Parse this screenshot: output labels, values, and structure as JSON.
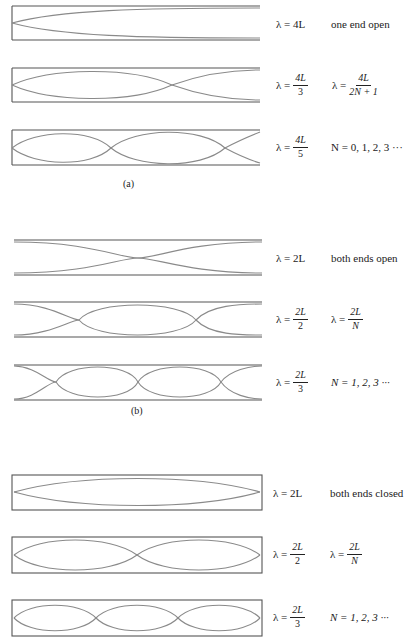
{
  "figure": {
    "stroke_color": "#555555",
    "wave_color": "#8a8a8a",
    "panels": [
      {
        "id": "a",
        "caption": "(a)",
        "boundary": "one end open",
        "rows": [
          {
            "harmonic": 1,
            "lambda_text": "λ = 4L",
            "lambda_num": "4L",
            "lambda_den": "",
            "note": "one end open"
          },
          {
            "harmonic": 3,
            "lambda_text": "λ = 4L/3",
            "lambda_num": "4L",
            "lambda_den": "3",
            "note_prefix": "λ =",
            "note_num": "4L",
            "note_den": "2N + 1"
          },
          {
            "harmonic": 5,
            "lambda_text": "λ = 4L/5",
            "lambda_num": "4L",
            "lambda_den": "5",
            "note": "N = 0, 1, 2, 3  ···"
          }
        ]
      },
      {
        "id": "b",
        "caption": "(b)",
        "boundary": "both ends open",
        "rows": [
          {
            "harmonic": 1,
            "lambda_text": "λ = 2L",
            "lambda_num": "2L",
            "lambda_den": "",
            "note": "both ends open"
          },
          {
            "harmonic": 2,
            "lambda_text": "λ = 2L/2",
            "lambda_num": "2L",
            "lambda_den": "2",
            "note_prefix": "λ =",
            "note_num": "2L",
            "note_den": "N"
          },
          {
            "harmonic": 3,
            "lambda_text": "λ = 2L/3",
            "lambda_num": "2L",
            "lambda_den": "3",
            "note": "N = 1, 2, 3  ···"
          }
        ]
      },
      {
        "id": "c",
        "caption": "",
        "boundary": "both ends closed",
        "rows": [
          {
            "harmonic": 1,
            "lambda_text": "λ = 2L",
            "lambda_num": "2L",
            "lambda_den": "",
            "note": "both ends closed"
          },
          {
            "harmonic": 2,
            "lambda_text": "λ = 2L/2",
            "lambda_num": "2L",
            "lambda_den": "2",
            "note_prefix": "λ =",
            "note_num": "2L",
            "note_den": "N"
          },
          {
            "harmonic": 3,
            "lambda_text": "λ = 2L/3",
            "lambda_num": "2L",
            "lambda_den": "3",
            "note": "N = 1, 2, 3 ···"
          }
        ]
      }
    ],
    "labels": {
      "lambda_prefix": "λ =",
      "a_row1_eq": "λ = 4L",
      "a_row1_note": "one end open",
      "a_row2_num": "4L",
      "a_row2_den": "3",
      "a_row2_note_num": "4L",
      "a_row2_note_den": "2N + 1",
      "a_row3_num": "4L",
      "a_row3_den": "5",
      "a_row3_note": "N = 0, 1, 2, 3  ···",
      "a_caption": "(a)",
      "b_row1_eq": "λ = 2L",
      "b_row1_note": "both ends open",
      "b_row2_num": "2L",
      "b_row2_den": "2",
      "b_row2_note_num": "2L",
      "b_row2_note_den": "N",
      "b_row3_num": "2L",
      "b_row3_den": "3",
      "b_row3_note": "N = 1, 2, 3  ···",
      "b_caption": "(b)",
      "c_row1_eq": "λ = 2L",
      "c_row1_note": "both ends closed",
      "c_row2_num": "2L",
      "c_row2_den": "2",
      "c_row2_note_num": "2L",
      "c_row2_note_den": "N",
      "c_row3_num": "2L",
      "c_row3_den": "3",
      "c_row3_note": "N = 1, 2, 3 ···"
    }
  }
}
